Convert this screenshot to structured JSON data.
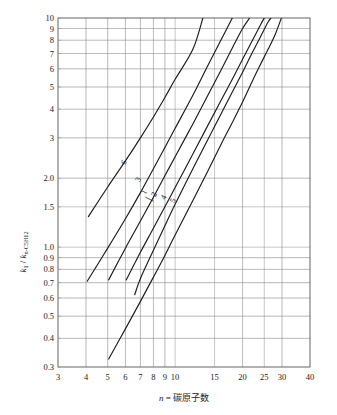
{
  "chart_data": {
    "type": "line",
    "title": "",
    "xlabel": "n = 碳原子数",
    "ylabel": "k₁ / k n-C₅H₁₂",
    "ylabel_parts": {
      "num": "k",
      "num_sub": "1",
      "den": "k",
      "den_sub": "n-C5H12"
    },
    "xscale": "log",
    "yscale": "log",
    "xlim": [
      3,
      40
    ],
    "ylim": [
      0.3,
      10
    ],
    "grid": true,
    "legend": "inline-curve-labels",
    "x_tick_labels": [
      "3",
      "4",
      "5",
      "6",
      "7",
      "8",
      "9",
      "10",
      "15",
      "20",
      "25",
      "30",
      "40"
    ],
    "x_tick_values": [
      3,
      4,
      5,
      6,
      7,
      8,
      9,
      10,
      15,
      20,
      25,
      30,
      40
    ],
    "y_tick_labels": [
      "0.3",
      "0.4",
      "0.5",
      "0.6",
      "0.7",
      "0.8",
      "0.9",
      "1.0",
      "1.5",
      "2.0",
      "3",
      "4",
      "5",
      "6",
      "7",
      "8",
      "9",
      "10"
    ],
    "y_tick_values": [
      0.3,
      0.4,
      0.5,
      0.6,
      0.7,
      0.8,
      0.9,
      1.0,
      1.5,
      2.0,
      3,
      4,
      5,
      6,
      7,
      8,
      9,
      10
    ],
    "x_grid_values": [
      4,
      5,
      6,
      7,
      8,
      9,
      10,
      15,
      20,
      25,
      30
    ],
    "y_grid_values": [
      0.4,
      0.5,
      0.6,
      0.7,
      0.8,
      0.9,
      1.0,
      1.5,
      2.0,
      3,
      4,
      5,
      6,
      7,
      8,
      9
    ],
    "series": [
      {
        "name": "6",
        "label": "6",
        "label_at": {
          "x": 6.05,
          "y": 2.32
        },
        "points": [
          [
            4.1,
            1.36
          ],
          [
            5,
            1.83
          ],
          [
            6,
            2.38
          ],
          [
            7,
            3.0
          ],
          [
            8,
            3.7
          ],
          [
            9,
            4.5
          ],
          [
            10,
            5.4
          ],
          [
            12,
            7.3
          ],
          [
            13.3,
            10.0
          ]
        ]
      },
      {
        "name": "3",
        "label": "3",
        "label_at": {
          "x": 7.0,
          "y": 1.95
        },
        "points": [
          [
            4.05,
            0.71
          ],
          [
            5,
            0.99
          ],
          [
            6,
            1.33
          ],
          [
            7,
            1.73
          ],
          [
            8,
            2.2
          ],
          [
            9,
            2.72
          ],
          [
            10,
            3.3
          ],
          [
            12,
            4.6
          ],
          [
            14,
            6.2
          ],
          [
            16,
            8.0
          ],
          [
            18,
            10.0
          ]
        ]
      },
      {
        "name": "1",
        "label": "1",
        "label_at": {
          "x": 7.45,
          "y": 1.72
        },
        "points": [
          [
            5.05,
            0.72
          ],
          [
            6,
            0.99
          ],
          [
            7,
            1.3
          ],
          [
            8,
            1.65
          ],
          [
            9,
            2.05
          ],
          [
            10,
            2.48
          ],
          [
            12,
            3.45
          ],
          [
            14,
            4.6
          ],
          [
            16,
            5.9
          ],
          [
            18,
            7.4
          ],
          [
            20,
            9.0
          ],
          [
            21.5,
            10.0
          ]
        ]
      },
      {
        "name": "2",
        "label": "2",
        "label_at": {
          "x": 8.25,
          "y": 1.68
        },
        "points": [
          [
            6.05,
            0.72
          ],
          [
            7,
            0.95
          ],
          [
            8,
            1.21
          ],
          [
            9,
            1.5
          ],
          [
            10,
            1.82
          ],
          [
            12,
            2.55
          ],
          [
            14,
            3.4
          ],
          [
            16,
            4.35
          ],
          [
            18,
            5.4
          ],
          [
            20,
            6.6
          ],
          [
            22,
            7.9
          ],
          [
            24,
            9.3
          ],
          [
            25,
            10.0
          ]
        ]
      },
      {
        "name": "4",
        "label": "4",
        "label_at": {
          "x": 9.1,
          "y": 1.63
        },
        "points": [
          [
            6.6,
            0.62
          ],
          [
            7,
            0.73
          ],
          [
            8,
            0.97
          ],
          [
            9,
            1.24
          ],
          [
            10,
            1.54
          ],
          [
            12,
            2.2
          ],
          [
            14,
            2.95
          ],
          [
            16,
            3.8
          ],
          [
            18,
            4.75
          ],
          [
            20,
            5.8
          ],
          [
            22,
            7.0
          ],
          [
            24,
            8.25
          ],
          [
            26,
            9.6
          ],
          [
            26.8,
            10.0
          ]
        ]
      },
      {
        "name": "5",
        "label": "5",
        "label_at": {
          "x": 10.0,
          "y": 1.58
        },
        "points": [
          [
            5.05,
            0.325
          ],
          [
            6,
            0.44
          ],
          [
            7,
            0.58
          ],
          [
            8,
            0.74
          ],
          [
            9,
            0.92
          ],
          [
            10,
            1.13
          ],
          [
            12,
            1.6
          ],
          [
            14,
            2.15
          ],
          [
            16,
            2.8
          ],
          [
            18,
            3.5
          ],
          [
            20,
            4.3
          ],
          [
            22,
            5.25
          ],
          [
            24,
            6.25
          ],
          [
            26,
            7.3
          ],
          [
            28,
            8.5
          ],
          [
            29.8,
            10.0
          ]
        ]
      }
    ]
  }
}
